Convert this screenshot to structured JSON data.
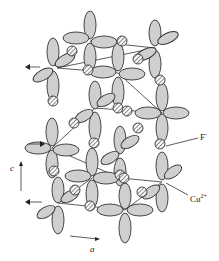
{
  "diagram": {
    "type": "crystal-structure",
    "labels": {
      "anion": "F",
      "anion_charge": "-",
      "cation": "Cu",
      "cation_charge": "2+",
      "axis_c": "c",
      "axis_a": "a"
    },
    "colors": {
      "lobe_fill": "#cfcfcf",
      "outline": "#333333",
      "background": "#ffffff"
    }
  }
}
